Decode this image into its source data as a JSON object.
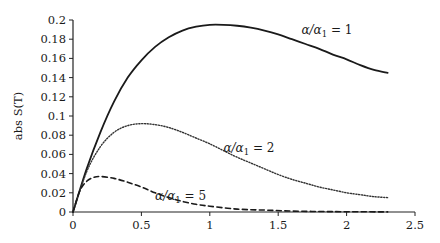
{
  "chart_data": {
    "type": "line",
    "title": "",
    "xlabel": "",
    "ylabel": "abs S(T)",
    "xlim": [
      0,
      2.5
    ],
    "ylim": [
      0,
      0.2
    ],
    "x_ticks": [
      "0",
      "0.5",
      "1",
      "1.5",
      "2",
      "2.5"
    ],
    "y_ticks": [
      "0",
      "0.02",
      "0.04",
      "0.06",
      "0.08",
      "0.1",
      "0.12",
      "0.14",
      "0.16",
      "0.18",
      "0.2"
    ],
    "grid": false,
    "legend": "inline annotations",
    "series": [
      {
        "name": "α/α1 = 1",
        "style": "solid",
        "x": [
          0,
          0.1,
          0.2,
          0.3,
          0.4,
          0.5,
          0.6,
          0.7,
          0.8,
          0.9,
          1.0,
          1.1,
          1.2,
          1.3,
          1.4,
          1.5,
          1.6,
          1.7,
          1.8,
          1.9,
          2.0,
          2.1,
          2.2,
          2.3
        ],
        "values": [
          0,
          0.045,
          0.083,
          0.115,
          0.14,
          0.158,
          0.172,
          0.182,
          0.189,
          0.193,
          0.195,
          0.195,
          0.194,
          0.192,
          0.189,
          0.185,
          0.18,
          0.175,
          0.17,
          0.164,
          0.159,
          0.153,
          0.148,
          0.145
        ]
      },
      {
        "name": "α/α1 = 2",
        "style": "dotted",
        "x": [
          0,
          0.1,
          0.2,
          0.3,
          0.4,
          0.5,
          0.6,
          0.7,
          0.8,
          0.9,
          1.0,
          1.1,
          1.2,
          1.3,
          1.4,
          1.5,
          1.6,
          1.7,
          1.8,
          1.9,
          2.0,
          2.1,
          2.2,
          2.3
        ],
        "values": [
          0,
          0.042,
          0.068,
          0.083,
          0.09,
          0.092,
          0.091,
          0.088,
          0.083,
          0.077,
          0.071,
          0.064,
          0.057,
          0.051,
          0.045,
          0.039,
          0.034,
          0.03,
          0.026,
          0.023,
          0.02,
          0.018,
          0.016,
          0.015
        ]
      },
      {
        "name": "α/α1 = 5",
        "style": "dashed",
        "x": [
          0,
          0.05,
          0.1,
          0.15,
          0.2,
          0.3,
          0.4,
          0.5,
          0.6,
          0.7,
          0.8,
          0.9,
          1.0,
          1.2,
          1.4,
          1.6,
          1.8,
          2.0,
          2.3
        ],
        "values": [
          0,
          0.022,
          0.032,
          0.036,
          0.037,
          0.035,
          0.031,
          0.026,
          0.02,
          0.015,
          0.011,
          0.008,
          0.006,
          0.003,
          0.002,
          0.001,
          0.0005,
          0.0003,
          0.0001
        ]
      }
    ],
    "annotations": [
      {
        "text_main": "α/α",
        "subscript": "1",
        "text_tail": " = 1",
        "x": 1.67,
        "y": 0.185
      },
      {
        "text_main": "α/α",
        "subscript": "1",
        "text_tail": " = 2",
        "x": 1.1,
        "y": 0.062
      },
      {
        "text_main": "α/α",
        "subscript": "1",
        "text_tail": " = 5",
        "x": 0.6,
        "y": 0.012
      }
    ]
  }
}
